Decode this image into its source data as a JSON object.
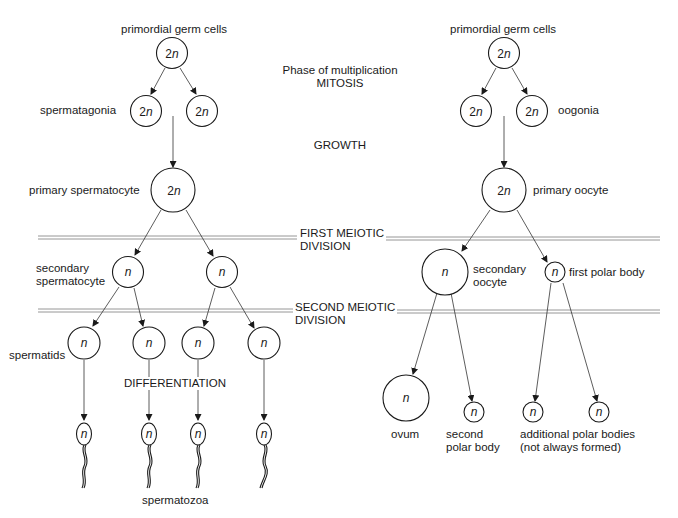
{
  "diagram": {
    "type": "flowchart",
    "phases": {
      "multiplication_line1": "Phase of multiplication",
      "multiplication_line2": "MITOSIS",
      "growth": "GROWTH",
      "first_meiotic_line1": "FIRST MEIOTIC",
      "first_meiotic_line2": "DIVISION",
      "second_meiotic_line1": "SECOND MEIOTIC",
      "second_meiotic_line2": "DIVISION",
      "differentiation": "DIFFERENTIATION"
    },
    "male": {
      "primordial_label": "primordial germ cells",
      "spermatagonia_label": "spermatagonia",
      "primary_label": "primary spermatocyte",
      "secondary_label_line1": "secondary",
      "secondary_label_line2": "spermatocyte",
      "spermatids_label": "spermatids",
      "spermatozoa_label": "spermatozoa"
    },
    "female": {
      "primordial_label": "primordial germ cells",
      "oogonia_label": "oogonia",
      "primary_label": "primary oocyte",
      "secondary_label_line1": "secondary",
      "secondary_label_line2": "oocyte",
      "first_polar_label": "first polar body",
      "ovum_label": "ovum",
      "second_polar_line1": "second",
      "second_polar_line2": "polar body",
      "additional_line1": "additional polar bodies",
      "additional_line2": "(not always formed)"
    },
    "ploidy": {
      "diploid_num": "2",
      "haploid": "n"
    },
    "nodes": [
      {
        "id": "m-pgc",
        "ploidy": "2n"
      },
      {
        "id": "m-sg1",
        "ploidy": "2n"
      },
      {
        "id": "m-sg2",
        "ploidy": "2n"
      },
      {
        "id": "m-ps",
        "ploidy": "2n"
      },
      {
        "id": "m-ss1",
        "ploidy": "n"
      },
      {
        "id": "m-ss2",
        "ploidy": "n"
      },
      {
        "id": "m-st1",
        "ploidy": "n"
      },
      {
        "id": "m-st2",
        "ploidy": "n"
      },
      {
        "id": "m-st3",
        "ploidy": "n"
      },
      {
        "id": "m-st4",
        "ploidy": "n"
      },
      {
        "id": "m-sz1",
        "ploidy": "n"
      },
      {
        "id": "m-sz2",
        "ploidy": "n"
      },
      {
        "id": "m-sz3",
        "ploidy": "n"
      },
      {
        "id": "m-sz4",
        "ploidy": "n"
      },
      {
        "id": "f-pgc",
        "ploidy": "2n"
      },
      {
        "id": "f-og1",
        "ploidy": "2n"
      },
      {
        "id": "f-og2",
        "ploidy": "2n"
      },
      {
        "id": "f-po",
        "ploidy": "2n"
      },
      {
        "id": "f-so",
        "ploidy": "n"
      },
      {
        "id": "f-pb1",
        "ploidy": "n"
      },
      {
        "id": "f-ovum",
        "ploidy": "n"
      },
      {
        "id": "f-pb2",
        "ploidy": "n"
      },
      {
        "id": "f-apb1",
        "ploidy": "n"
      },
      {
        "id": "f-apb2",
        "ploidy": "n"
      }
    ]
  }
}
